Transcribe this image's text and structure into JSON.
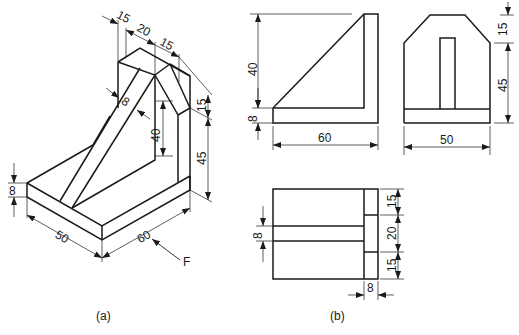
{
  "figure": {
    "caption_a": "(a)",
    "caption_b": "(b)",
    "view_arrow_label": "F"
  },
  "isometric": {
    "dims": {
      "top_offset_1": "15",
      "top_width": "20",
      "top_offset_2": "15",
      "rib_thickness": "8",
      "rib_height": "40",
      "chamfer_height": "15",
      "wall_height": "45",
      "base_thickness": "8",
      "base_depth": "50",
      "base_length": "60"
    }
  },
  "front_view": {
    "dims": {
      "height_upper": "40",
      "base_thickness": "8",
      "length": "60"
    }
  },
  "side_view": {
    "dims": {
      "chamfer_height": "15",
      "wall_height": "45",
      "width": "50"
    }
  },
  "top_view": {
    "dims": {
      "rib_thickness": "8",
      "seg_top": "15",
      "seg_mid": "20",
      "seg_bottom": "15",
      "wall_thickness": "8"
    }
  }
}
